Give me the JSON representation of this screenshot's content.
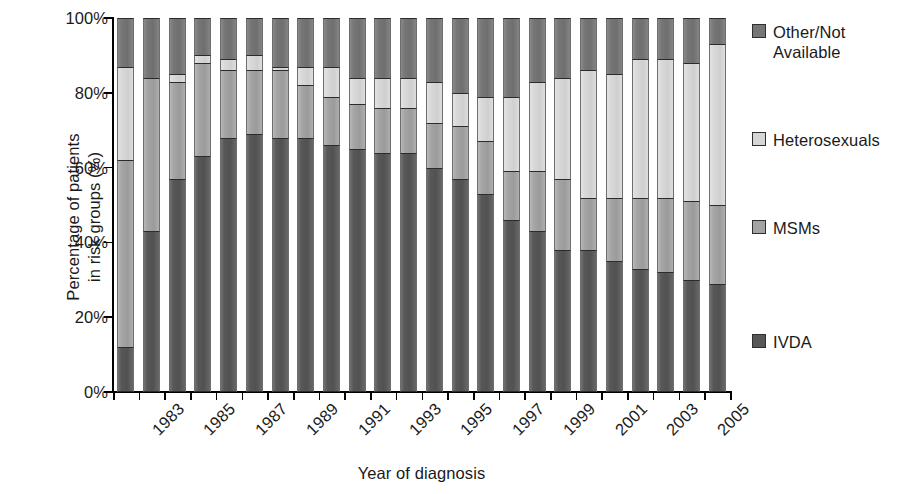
{
  "chart_data": {
    "type": "bar",
    "subtype": "stacked-percentage",
    "title": "",
    "xlabel": "Year of diagnosis",
    "ylabel": "Percentage of patients in risk groups (%)",
    "ylabel_line1": "Percentage of patients",
    "ylabel_line2": "in risk groups (%)",
    "ylim": [
      0,
      100
    ],
    "ytick_labels": [
      "0%",
      "20%",
      "40%",
      "60%",
      "80%",
      "100%"
    ],
    "ytick_values": [
      0,
      20,
      40,
      60,
      80,
      100
    ],
    "grid": false,
    "legend_position": "right",
    "categories": [
      "1983",
      "1984",
      "1985",
      "1986",
      "1987",
      "1988",
      "1989",
      "1990",
      "1991",
      "1992",
      "1993",
      "1994",
      "1995",
      "1996",
      "1997",
      "1998",
      "1999",
      "2000",
      "2001",
      "2002",
      "2003",
      "2004",
      "2005",
      "2006"
    ],
    "xtick_labels_shown": [
      "1983",
      "1985",
      "1987",
      "1989",
      "1991",
      "1993",
      "1995",
      "1997",
      "1999",
      "2001",
      "2003",
      "2005"
    ],
    "series": [
      {
        "name": "IVDA",
        "color": "#575757",
        "values": [
          12,
          43,
          57,
          63,
          68,
          69,
          68,
          68,
          66,
          65,
          64,
          64,
          60,
          57,
          53,
          46,
          43,
          38,
          38,
          35,
          33,
          32,
          30,
          29
        ]
      },
      {
        "name": "MSMs",
        "color": "#a3a3a3",
        "values": [
          50,
          41,
          26,
          25,
          18,
          17,
          18,
          14,
          13,
          12,
          12,
          12,
          12,
          14,
          14,
          13,
          16,
          19,
          14,
          17,
          19,
          20,
          21,
          21
        ]
      },
      {
        "name": "Heterosexuals",
        "color": "#d6d6d6",
        "values": [
          25,
          0,
          2,
          2,
          3,
          4,
          1,
          5,
          8,
          7,
          8,
          8,
          11,
          9,
          12,
          20,
          24,
          27,
          34,
          33,
          37,
          37,
          37,
          43
        ]
      },
      {
        "name": "Other/Not Available",
        "color": "#767676",
        "values": [
          13,
          16,
          15,
          10,
          11,
          10,
          13,
          13,
          13,
          16,
          16,
          16,
          17,
          20,
          21,
          21,
          17,
          16,
          14,
          15,
          11,
          11,
          12,
          7
        ]
      }
    ],
    "legend_entries": [
      {
        "label": "Other/Not\nAvailable",
        "color": "#767676"
      },
      {
        "label": "Heterosexuals",
        "color": "#d6d6d6"
      },
      {
        "label": "MSMs",
        "color": "#a3a3a3"
      },
      {
        "label": "IVDA",
        "color": "#575757"
      }
    ]
  }
}
